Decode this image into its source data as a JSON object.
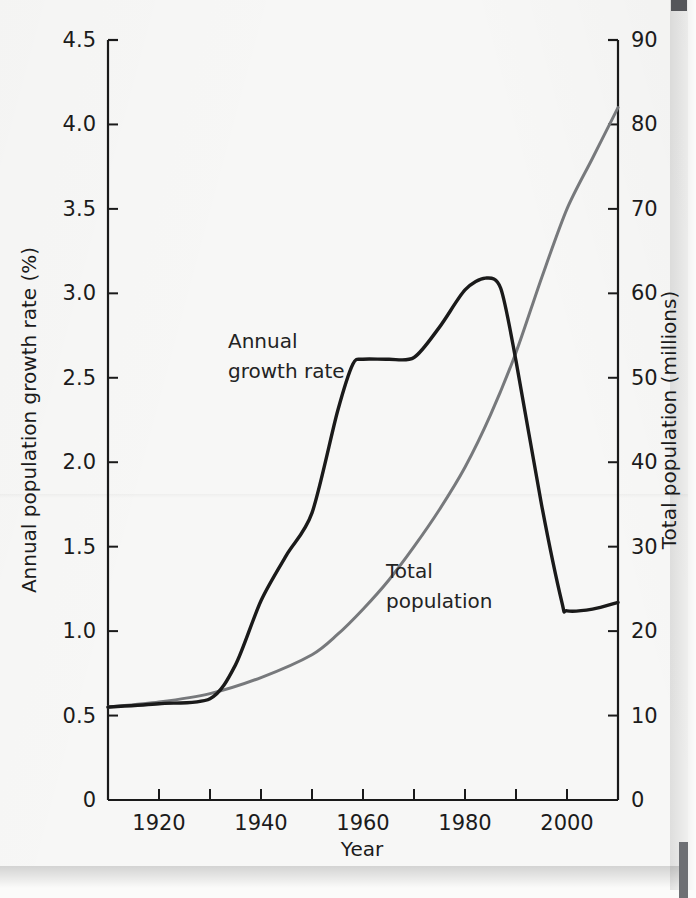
{
  "chart_data": {
    "type": "line",
    "title": "",
    "xlabel": "Year",
    "ylabel": "Annual population growth rate (%)",
    "y2label": "Total population (millions)",
    "xlim": [
      1910,
      2010
    ],
    "ylim": [
      0,
      4.5
    ],
    "y2lim": [
      0,
      90
    ],
    "xticks": [
      1920,
      1940,
      1960,
      1980,
      2000
    ],
    "xtick_labels": [
      "1920",
      "1940",
      "1960",
      "1980",
      "2000"
    ],
    "xtick_minor_step": 10,
    "yticks": [
      0,
      0.5,
      1.0,
      1.5,
      2.0,
      2.5,
      3.0,
      3.5,
      4.0,
      4.5
    ],
    "ytick_labels": [
      "0",
      "0.5",
      "1.0",
      "1.5",
      "2.0",
      "2.5",
      "3.0",
      "3.5",
      "4.0",
      "4.5"
    ],
    "y2ticks": [
      0,
      10,
      20,
      30,
      40,
      50,
      60,
      70,
      80,
      90
    ],
    "y2tick_labels": [
      "0",
      "10",
      "20",
      "30",
      "40",
      "50",
      "60",
      "70",
      "80",
      "90"
    ],
    "grid": false,
    "legend": "inline-annotations",
    "series": [
      {
        "name": "Annual growth rate",
        "axis": "left",
        "units": "%",
        "color": "#1a1a1a",
        "annotation_lines": [
          "Annual",
          "growth rate"
        ],
        "x": [
          1910,
          1920,
          1930,
          1935,
          1940,
          1945,
          1950,
          1955,
          1958,
          1960,
          1965,
          1970,
          1975,
          1980,
          1984,
          1987,
          1990,
          1995,
          1999,
          2000,
          2005,
          2010
        ],
        "values": [
          0.55,
          0.57,
          0.6,
          0.8,
          1.18,
          1.45,
          1.7,
          2.3,
          2.58,
          2.61,
          2.61,
          2.62,
          2.8,
          3.02,
          3.09,
          3.03,
          2.6,
          1.75,
          1.17,
          1.12,
          1.13,
          1.17
        ]
      },
      {
        "name": "Total population",
        "axis": "right",
        "units": "millions",
        "color": "#77797c",
        "annotation_lines": [
          "Total",
          "population"
        ],
        "x": [
          1910,
          1920,
          1930,
          1940,
          1950,
          1955,
          1960,
          1965,
          1970,
          1975,
          1980,
          1985,
          1990,
          1995,
          2000,
          2005,
          2010
        ],
        "values": [
          11.0,
          11.6,
          12.6,
          14.5,
          17.2,
          19.6,
          22.6,
          26.0,
          30.0,
          34.4,
          39.4,
          45.6,
          53.0,
          61.8,
          70.0,
          76.0,
          82.0
        ]
      }
    ]
  },
  "annotations": {
    "growth_label_line1": "Annual",
    "growth_label_line2": "growth rate",
    "population_label_line1": "Total",
    "population_label_line2": "population"
  },
  "axes": {
    "x_title": "Year",
    "y_left_title": "Annual population growth rate (%)",
    "y_right_title": "Total population (millions)"
  },
  "colors": {
    "growth_rate_line": "#1a1a1a",
    "population_line": "#77797c",
    "axis": "#1a1a1a",
    "paper": "#f7f7f6"
  }
}
